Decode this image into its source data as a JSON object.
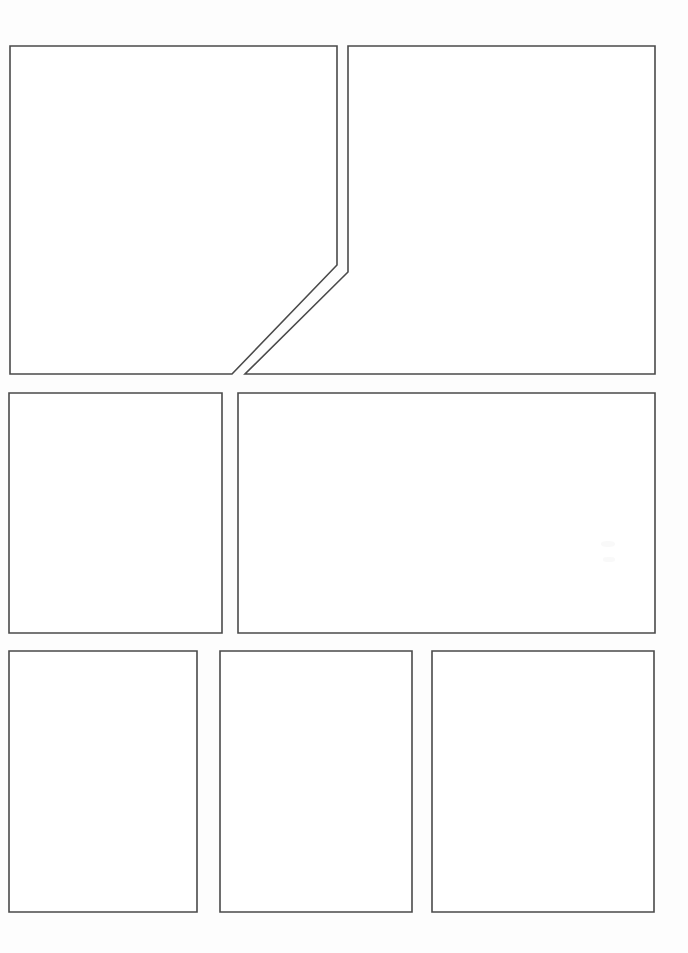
{
  "page": {
    "width": 688,
    "height": 953,
    "background_color": "#fdfdfd",
    "panel_fill_color": "#ffffff",
    "panel_border_color": "#4a4a4a",
    "panel_border_width": "1.6",
    "panel_count": 7,
    "row_count": 3,
    "reading_order": "right-to-left"
  },
  "panels": [
    {
      "id": "panel-1",
      "label": "Panel 1",
      "row": 1,
      "shape": "pentagon-diagonal-cut",
      "points": "10,46 337,46 337,265 232,374 10,374",
      "bounds": {
        "x": 10,
        "y": 46,
        "width": 327,
        "height": 328
      },
      "content": ""
    },
    {
      "id": "panel-2",
      "label": "Panel 2",
      "row": 1,
      "shape": "pentagon-diagonal-cut",
      "points": "348,46 655,46 655,374 245,374 348,272",
      "bounds": {
        "x": 245,
        "y": 46,
        "width": 410,
        "height": 328
      },
      "content": ""
    },
    {
      "id": "panel-3",
      "label": "Panel 3",
      "row": 2,
      "shape": "rectangle",
      "points": "9,393 222,393 222,633 9,633",
      "bounds": {
        "x": 9,
        "y": 393,
        "width": 213,
        "height": 240
      },
      "content": ""
    },
    {
      "id": "panel-4",
      "label": "Panel 4",
      "row": 2,
      "shape": "rectangle",
      "points": "238,393 655,393 655,633 238,633",
      "bounds": {
        "x": 238,
        "y": 393,
        "width": 417,
        "height": 240
      },
      "content": ""
    },
    {
      "id": "panel-5",
      "label": "Panel 5",
      "row": 3,
      "shape": "rectangle",
      "points": "9,651 197,651 197,912 9,912",
      "bounds": {
        "x": 9,
        "y": 651,
        "width": 188,
        "height": 261
      },
      "content": ""
    },
    {
      "id": "panel-6",
      "label": "Panel 6",
      "row": 3,
      "shape": "rectangle",
      "points": "220,651 412,651 412,912 220,912",
      "bounds": {
        "x": 220,
        "y": 651,
        "width": 192,
        "height": 261
      },
      "content": ""
    },
    {
      "id": "panel-7",
      "label": "Panel 7",
      "row": 3,
      "shape": "rectangle",
      "points": "432,651 654,651 654,912 432,912",
      "bounds": {
        "x": 432,
        "y": 651,
        "width": 222,
        "height": 261
      },
      "content": ""
    }
  ],
  "artifacts": [
    {
      "id": "smudge-1",
      "x": 601,
      "y": 541,
      "width": 14,
      "height": 6
    },
    {
      "id": "smudge-2",
      "x": 603,
      "y": 557,
      "width": 12,
      "height": 5
    }
  ]
}
